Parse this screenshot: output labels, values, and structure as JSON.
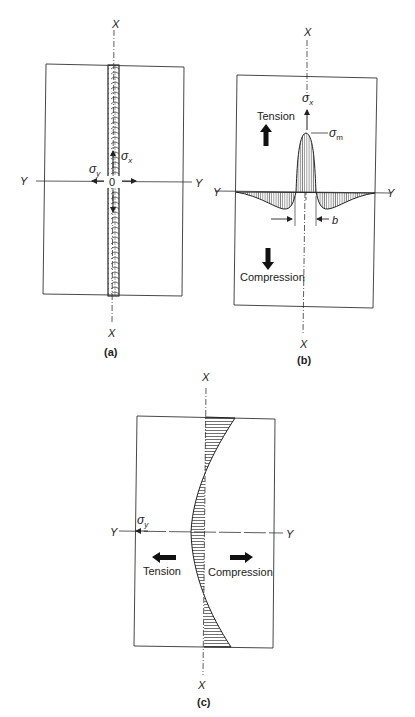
{
  "panels": {
    "a": {
      "caption": "(a)",
      "axis_x_top": "X",
      "axis_x_bottom": "X",
      "axis_y_left": "Y",
      "axis_y_right": "Y",
      "sigma_x": "σ",
      "sigma_x_sub": "x",
      "sigma_y": "σ",
      "sigma_y_sub": "y",
      "origin": "0"
    },
    "b": {
      "caption": "(b)",
      "axis_x_top": "X",
      "axis_x_bottom": "X",
      "axis_y_left": "Y",
      "axis_y_right": "Y",
      "sigma_x": "σ",
      "sigma_x_sub": "x",
      "sigma_m": "σ",
      "sigma_m_sub": "m",
      "tension_label": "Tension",
      "compression_label": "Compression",
      "width_label": "b"
    },
    "c": {
      "caption": "(c)",
      "axis_x_top": "X",
      "axis_x_bottom": "X",
      "axis_y_left": "Y",
      "axis_y_right": "Y",
      "sigma_y": "σ",
      "sigma_y_sub": "y",
      "tension_label": "Tension",
      "compression_label": "Compression"
    }
  },
  "colors": {
    "line": "#333333",
    "text": "#222222",
    "background": "#ffffff"
  }
}
